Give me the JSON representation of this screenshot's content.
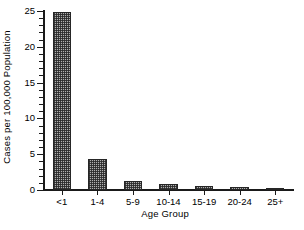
{
  "chart_data": {
    "type": "bar",
    "title": "",
    "xlabel": "Age Group",
    "ylabel": "Cases per 100,000 Population",
    "categories": [
      "<1",
      "1-4",
      "5-9",
      "10-14",
      "15-19",
      "20-24",
      "25+"
    ],
    "values": [
      24.8,
      4.4,
      1.3,
      0.9,
      0.5,
      0.4,
      0.3
    ],
    "ylim": [
      0,
      25
    ],
    "ytick_labels": [
      "0",
      "5",
      "10",
      "15",
      "20",
      "25"
    ],
    "ytick_values": [
      0,
      5,
      10,
      15,
      20,
      25
    ],
    "yminor_step": 1,
    "grid": false,
    "legend": false,
    "bar_fill": "#b0b0b0",
    "bar_edge": "#262626",
    "axis_color": "#1a1a1a",
    "background": "#ffffff"
  }
}
